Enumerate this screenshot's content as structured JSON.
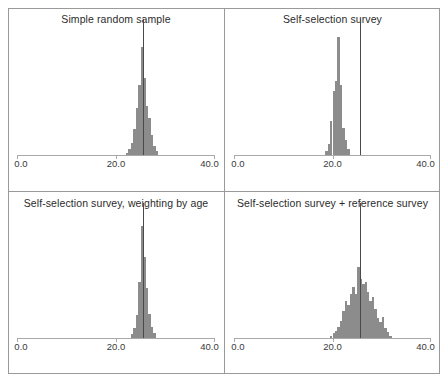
{
  "figure": {
    "type": "histogram-matrix",
    "rows": 2,
    "columns": 2,
    "bar_color": "#8c8c8c",
    "reference_line_color": "#4a4a4a",
    "axis_color": "#a9a9a9",
    "frame_color": "#9a9a9a"
  },
  "axis": {
    "xlim": [
      0.0,
      40.0
    ],
    "tick_values": [
      0.0,
      20.0,
      40.0
    ],
    "tick_labels": [
      "0.0",
      "20.0",
      "40.0"
    ],
    "xlabel": "",
    "ylabel": "",
    "grid": false
  },
  "chart_data": [
    {
      "type": "bar",
      "panel": 1,
      "title": "Simple random sample",
      "xlabel": "",
      "ylabel": "",
      "xlim": [
        0.0,
        40.0
      ],
      "ylim": [
        0,
        100
      ],
      "grid": false,
      "legend": "none",
      "bin_width": 0.5,
      "reference_line": 25.5,
      "bin_centers": [
        22.25,
        22.75,
        23.25,
        23.75,
        24.25,
        24.75,
        25.25,
        25.75,
        26.25,
        26.75,
        27.25,
        27.75,
        28.25
      ],
      "values": [
        2,
        5,
        10,
        21,
        38,
        57,
        88,
        63,
        40,
        30,
        16,
        7,
        3
      ]
    },
    {
      "type": "bar",
      "panel": 2,
      "title": "Self-selection survey",
      "xlabel": "",
      "ylabel": "",
      "xlim": [
        0.0,
        40.0
      ],
      "ylim": [
        0,
        100
      ],
      "grid": false,
      "legend": "none",
      "bin_width": 0.5,
      "reference_line": 25.5,
      "bin_centers": [
        18.75,
        19.25,
        19.75,
        20.25,
        20.75,
        21.25,
        21.75,
        22.25,
        22.75,
        23.25
      ],
      "values": [
        3,
        9,
        28,
        52,
        60,
        96,
        57,
        22,
        12,
        5
      ]
    },
    {
      "type": "bar",
      "panel": 3,
      "title": "Self-selection survey, weighting by age",
      "xlabel": "",
      "ylabel": "",
      "xlim": [
        0.0,
        40.0
      ],
      "ylim": [
        0,
        100
      ],
      "grid": false,
      "legend": "none",
      "bin_width": 0.5,
      "reference_line": 25.5,
      "bin_centers": [
        23.25,
        23.75,
        24.25,
        24.75,
        25.25,
        25.75,
        26.25,
        26.75,
        27.25,
        27.75
      ],
      "values": [
        3,
        8,
        19,
        46,
        92,
        66,
        41,
        20,
        9,
        4
      ]
    },
    {
      "type": "bar",
      "panel": 4,
      "title": "Self-selection survey + reference survey",
      "xlabel": "",
      "ylabel": "",
      "xlim": [
        0.0,
        40.0
      ],
      "ylim": [
        0,
        100
      ],
      "grid": false,
      "legend": "none",
      "bin_width": 0.5,
      "reference_line": 25.5,
      "bin_centers": [
        19.75,
        20.25,
        20.75,
        21.25,
        21.75,
        22.25,
        22.75,
        23.25,
        23.75,
        24.25,
        24.75,
        25.25,
        25.75,
        26.25,
        26.75,
        27.25,
        27.75,
        28.25,
        28.75,
        29.25,
        29.75,
        30.25,
        30.75,
        31.25,
        31.75
      ],
      "values": [
        2,
        4,
        6,
        9,
        14,
        22,
        30,
        27,
        36,
        42,
        36,
        58,
        48,
        44,
        46,
        38,
        30,
        34,
        24,
        16,
        13,
        17,
        8,
        5,
        2
      ]
    }
  ]
}
